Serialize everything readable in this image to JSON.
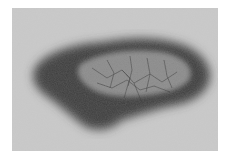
{
  "image": {
    "subject": "grayscale close-up of irregular pigmented skin lesion",
    "colors": {
      "border": "#ffffff",
      "skin": "#c9c9c9",
      "lesion_dark": "#4a4a4a",
      "lesion_center": "#8e8e8e"
    }
  }
}
